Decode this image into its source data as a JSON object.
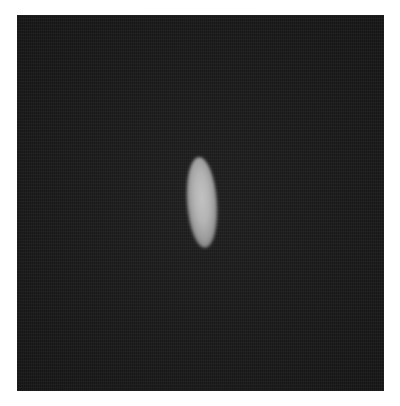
{
  "image": {
    "description": "Dark grayscale microscopy-style field with a single bright elongated blob near center",
    "background_color": "#1b1b1b",
    "border_color": "#ffffff",
    "frame": {
      "x": 17,
      "y": 15,
      "width": 367,
      "height": 376
    },
    "objects": [
      {
        "name": "bright-elongated-blob",
        "shape": "ellipse",
        "center": {
          "x": 202,
          "y": 203
        },
        "size": {
          "width": 30,
          "height": 91
        },
        "rotation_deg": -4,
        "peak_color": "#c2c2c2"
      }
    ]
  }
}
